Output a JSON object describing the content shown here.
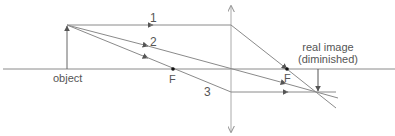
{
  "diagram": {
    "type": "converging-lens-ray-diagram",
    "colors": {
      "line": "#8a8a8a",
      "text": "#555555",
      "point": "#111111"
    },
    "labels": {
      "object": "object",
      "image_line1": "real image",
      "image_line2": "(diminished)",
      "focal_left": "F",
      "focal_right": "F",
      "ray1": "1",
      "ray2": "2",
      "ray3": "3"
    }
  }
}
